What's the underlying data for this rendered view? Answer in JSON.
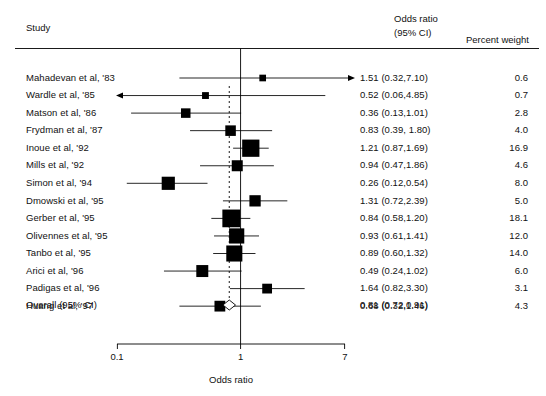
{
  "figure": {
    "type": "forest-plot",
    "x_axis_title": "Odds ratio",
    "columns": {
      "study": "Study",
      "effect_line1": "Odds ratio",
      "effect_line2": "(95% CI)",
      "weight": "Percent weight"
    },
    "overall_label": "Overall (95% CI)",
    "overall_text": "0.81 (0.72,0.91)"
  },
  "chart_data": {
    "type": "forest",
    "title": "",
    "xlabel": "Odds ratio",
    "ylabel": "",
    "xscale": "log",
    "xlim": [
      0.1,
      7
    ],
    "xticks": [
      0.1,
      1,
      7
    ],
    "xticklabels": [
      "0.1",
      "1",
      "7"
    ],
    "null_line": 1,
    "pooled_line": 0.81,
    "grid": false,
    "legend": null,
    "categories": [
      "Mahadevan et al, '83",
      "Wardle et al, '85",
      "Matson et al, '86",
      "Frydman et al, '87",
      "Inoue et al, '92",
      "Mills et al, '92",
      "Simon et al, '94",
      "Dmowski et al, '95",
      "Gerber et al, '95",
      "Olivennes et al, '95",
      "Tanbo et al, '95",
      "Arici et al, '96",
      "Padigas et al, '96",
      "Huang et al, '97"
    ],
    "estimates": [
      1.51,
      0.52,
      0.36,
      0.83,
      1.21,
      0.94,
      0.26,
      1.31,
      0.84,
      0.93,
      0.89,
      0.49,
      1.64,
      0.68
    ],
    "ci_low": [
      0.32,
      0.06,
      0.13,
      0.39,
      0.87,
      0.47,
      0.12,
      0.72,
      0.58,
      0.61,
      0.6,
      0.24,
      0.82,
      0.32
    ],
    "ci_high": [
      7.1,
      4.85,
      1.01,
      1.8,
      1.69,
      1.86,
      0.54,
      2.39,
      1.2,
      1.41,
      1.32,
      1.02,
      3.3,
      1.46
    ],
    "weights": [
      0.6,
      0.7,
      2.8,
      4.0,
      16.9,
      4.6,
      8.0,
      5.0,
      18.1,
      12.0,
      14.0,
      6.0,
      3.1,
      4.3
    ],
    "effect_labels": [
      "1.51 (0.32,7.10)",
      "0.52 (0.06,4.85)",
      "0.36 (0.13,1.01)",
      "0.83 (0.39, 1.80)",
      "1.21 (0.87,1.69)",
      "0.94 (0.47,1.86)",
      "0.26 (0.12,0.54)",
      "1.31 (0.72,2.39)",
      "0.84 (0.58,1.20)",
      "0.93 (0.61,1.41)",
      "0.89 (0.60,1.32)",
      "0.49 (0.24,1.02)",
      "1.64 (0.82,3.30)",
      "0.68 (0.32,1.46)"
    ],
    "weight_labels": [
      "0.6",
      "0.7",
      "2.8",
      "4.0",
      "16.9",
      "4.6",
      "8.0",
      "5.0",
      "18.1",
      "12.0",
      "14.0",
      "6.0",
      "3.1",
      "4.3"
    ],
    "arrow_right": [
      true,
      false,
      false,
      false,
      false,
      false,
      false,
      false,
      false,
      false,
      false,
      false,
      false,
      false
    ],
    "arrow_left": [
      false,
      true,
      false,
      false,
      false,
      false,
      false,
      false,
      false,
      false,
      false,
      false,
      false,
      false
    ],
    "overall": {
      "label": "Overall (95% CI)",
      "estimate": 0.81,
      "ci_low": 0.72,
      "ci_high": 0.91,
      "text": "0.81 (0.72,0.91)"
    }
  }
}
